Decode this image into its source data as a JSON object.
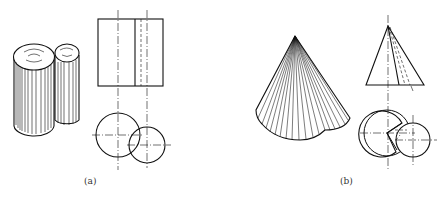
{
  "figure": {
    "panels": [
      {
        "id": "a",
        "label": "(a)",
        "description": "Two intersecting cylinders: isometric view, front view, top view",
        "isometric": {
          "shape": "two-intersecting-cylinders"
        },
        "front_view": {
          "shape": "rectangle-with-internal-line",
          "centerlines": 2,
          "hidden_lines": 1
        },
        "top_view": {
          "shape": "two-overlapping-circles",
          "centerlines": 2
        }
      },
      {
        "id": "b",
        "label": "(b)",
        "description": "Cone intersected with cylinder: isometric view, front view, top view",
        "isometric": {
          "shape": "cone-with-lobed-base"
        },
        "front_view": {
          "shape": "triangle-with-hidden-lines",
          "centerlines": 1,
          "hidden_lines": 2
        },
        "top_view": {
          "shape": "two-overlapping-circles-with-sector",
          "centerlines": 2
        }
      }
    ]
  },
  "colors": {
    "line": "#111111",
    "background": "#ffffff",
    "label": "#333333"
  }
}
